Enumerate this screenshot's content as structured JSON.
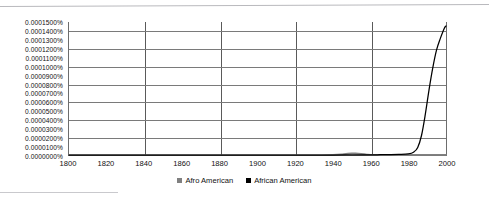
{
  "chart_data": {
    "type": "line",
    "title": "",
    "subtitle": "",
    "xlabel": "",
    "ylabel": "",
    "xlim": [
      1800,
      2000
    ],
    "ylim": [
      0.0,
      0.00015
    ],
    "grid": true,
    "legend_position": "bottom-center",
    "x_tick_labels": [
      "1800",
      "1820",
      "1840",
      "1860",
      "1880",
      "1900",
      "1920",
      "1940",
      "1960",
      "1980",
      "2000"
    ],
    "x_ticks": [
      1800,
      1820,
      1840,
      1860,
      1880,
      1900,
      1920,
      1940,
      1960,
      1980,
      2000
    ],
    "x_gridlines": [
      1840,
      1880,
      1920,
      1960
    ],
    "y_tick_labels": [
      "0.0001500%",
      "0.0001400%",
      "0.0001300%",
      "0.0001200%",
      "0.0001100%",
      "0.0001000%",
      "0.0000900%",
      "0.0000800%",
      "0.0000700%",
      "0.0000600%",
      "0.0000500%",
      "0.0000400%",
      "0.0000300%",
      "0.0000200%",
      "0.0000100%",
      "0.0000000%"
    ],
    "y_ticks": [
      0.00015,
      0.00014,
      0.00013,
      0.00012,
      0.00011,
      0.0001,
      9e-05,
      8e-05,
      7e-05,
      6e-05,
      5e-05,
      4e-05,
      3e-05,
      2e-05,
      1e-05,
      0.0
    ],
    "y_gridlines": [
      0.00014,
      0.00012,
      0.0001,
      8e-05,
      6e-05,
      4e-05,
      2e-05
    ],
    "series": [
      {
        "name": "Afro American",
        "color": "#808080",
        "x": [
          1800,
          1900,
          1920,
          1930,
          1940,
          1945,
          1948,
          1950,
          1952,
          1955,
          1958,
          1960,
          1965,
          1970,
          1980,
          1990,
          2000
        ],
        "values": [
          0.0,
          0.0,
          0.0,
          0.0,
          2e-07,
          8e-07,
          1.6e-06,
          1.9e-06,
          1.8e-06,
          1.3e-06,
          6e-07,
          3e-07,
          2e-07,
          1e-07,
          1e-07,
          1e-07,
          1e-07
        ]
      },
      {
        "name": "African American",
        "color": "#000000",
        "x": [
          1800,
          1850,
          1900,
          1920,
          1940,
          1950,
          1960,
          1965,
          1970,
          1975,
          1980,
          1983,
          1985,
          1987,
          1989,
          1991,
          1993,
          1995,
          1997,
          1999,
          2000
        ],
        "values": [
          0.0,
          0.0,
          0.0,
          0.0,
          0.0,
          1e-07,
          2e-07,
          3e-07,
          4e-07,
          6e-07,
          1.2e-06,
          3.5e-06,
          8.5e-06,
          2.2e-05,
          4.55e-05,
          7.35e-05,
          9.85e-05,
          0.0001185,
          0.0001315,
          0.0001425,
          0.0001455
        ]
      }
    ]
  },
  "legend": {
    "items": [
      {
        "label": "Afro American",
        "color": "#808080"
      },
      {
        "label": "African American",
        "color": "#000000"
      }
    ]
  }
}
